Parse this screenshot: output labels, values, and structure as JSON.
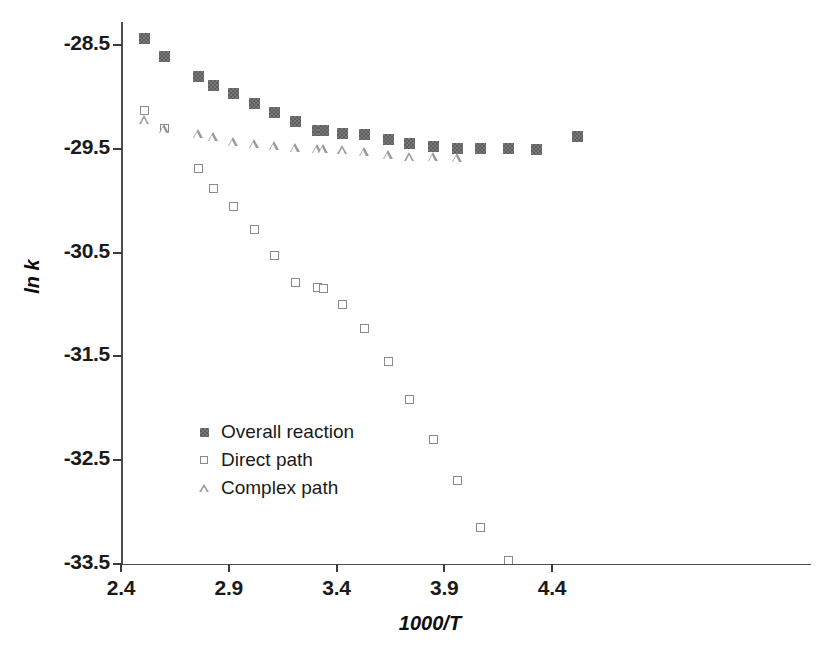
{
  "figure": {
    "background": "#ffffff",
    "marker_colors": {
      "overall_reaction": "#6b6b6b",
      "direct_path": "#8a8a8a",
      "complex_path": "#9a9a9a",
      "axis": "#3b3b3b",
      "text": "#1a1a1a"
    }
  },
  "chart_data": {
    "type": "scatter",
    "title": "",
    "xlabel": "1000/T",
    "ylabel": "ln k",
    "xlim": [
      2.35,
      4.6
    ],
    "ylim": [
      -33.5,
      -28.1
    ],
    "xticks": [
      2.4,
      2.9,
      3.4,
      3.9,
      4.4
    ],
    "xtick_labels": [
      "2.4",
      "2.9",
      "3.4",
      "3.9",
      "4.4"
    ],
    "yticks": [
      -28.5,
      -29.5,
      -30.5,
      -31.5,
      -32.5,
      -33.5
    ],
    "ytick_labels": [
      "-28.5",
      "-29.5",
      "-30.5",
      "-31.5",
      "-32.5",
      "-33.5"
    ],
    "grid": false,
    "legend_position": "center-left",
    "series": [
      {
        "name": "Overall reaction",
        "marker": "filled-square",
        "color": "#6b6b6b",
        "points": [
          {
            "x": 2.51,
            "y": -28.44
          },
          {
            "x": 2.6,
            "y": -28.61
          },
          {
            "x": 2.76,
            "y": -28.8
          },
          {
            "x": 2.83,
            "y": -28.89
          },
          {
            "x": 2.92,
            "y": -28.97
          },
          {
            "x": 3.02,
            "y": -29.06
          },
          {
            "x": 3.11,
            "y": -29.15
          },
          {
            "x": 3.21,
            "y": -29.24
          },
          {
            "x": 3.31,
            "y": -29.32
          },
          {
            "x": 3.34,
            "y": -29.32
          },
          {
            "x": 3.43,
            "y": -29.35
          },
          {
            "x": 3.53,
            "y": -29.36
          },
          {
            "x": 3.64,
            "y": -29.41
          },
          {
            "x": 3.74,
            "y": -29.45
          },
          {
            "x": 3.85,
            "y": -29.48
          },
          {
            "x": 3.96,
            "y": -29.5
          },
          {
            "x": 4.07,
            "y": -29.5
          },
          {
            "x": 4.2,
            "y": -29.5
          },
          {
            "x": 4.33,
            "y": -29.51
          },
          {
            "x": 4.52,
            "y": -29.38
          }
        ]
      },
      {
        "name": "Direct path",
        "marker": "open-square",
        "color": "#8a8a8a",
        "points": [
          {
            "x": 2.51,
            "y": -29.13
          },
          {
            "x": 2.6,
            "y": -29.3
          },
          {
            "x": 2.76,
            "y": -29.69
          },
          {
            "x": 2.83,
            "y": -29.88
          },
          {
            "x": 2.92,
            "y": -30.06
          },
          {
            "x": 3.02,
            "y": -30.28
          },
          {
            "x": 3.11,
            "y": -30.53
          },
          {
            "x": 3.21,
            "y": -30.79
          },
          {
            "x": 3.31,
            "y": -30.84
          },
          {
            "x": 3.34,
            "y": -30.85
          },
          {
            "x": 3.43,
            "y": -31.0
          },
          {
            "x": 3.53,
            "y": -31.23
          },
          {
            "x": 3.64,
            "y": -31.55
          },
          {
            "x": 3.74,
            "y": -31.92
          },
          {
            "x": 3.85,
            "y": -32.3
          },
          {
            "x": 3.96,
            "y": -32.7
          },
          {
            "x": 4.07,
            "y": -33.15
          },
          {
            "x": 4.2,
            "y": -33.47
          }
        ]
      },
      {
        "name": "Complex path",
        "marker": "open-triangle",
        "color": "#9a9a9a",
        "points": [
          {
            "x": 2.51,
            "y": -29.22
          },
          {
            "x": 2.6,
            "y": -29.31
          },
          {
            "x": 2.76,
            "y": -29.36
          },
          {
            "x": 2.83,
            "y": -29.39
          },
          {
            "x": 2.92,
            "y": -29.43
          },
          {
            "x": 3.02,
            "y": -29.45
          },
          {
            "x": 3.11,
            "y": -29.47
          },
          {
            "x": 3.21,
            "y": -29.49
          },
          {
            "x": 3.31,
            "y": -29.5
          },
          {
            "x": 3.34,
            "y": -29.5
          },
          {
            "x": 3.43,
            "y": -29.51
          },
          {
            "x": 3.53,
            "y": -29.53
          },
          {
            "x": 3.64,
            "y": -29.56
          },
          {
            "x": 3.74,
            "y": -29.58
          },
          {
            "x": 3.85,
            "y": -29.58
          },
          {
            "x": 3.96,
            "y": -29.59
          }
        ]
      }
    ]
  },
  "legend": {
    "entries": [
      {
        "label": "Overall reaction",
        "marker": "filled-square"
      },
      {
        "label": "Direct path",
        "marker": "open-square"
      },
      {
        "label": "Complex path",
        "marker": "open-triangle"
      }
    ]
  }
}
